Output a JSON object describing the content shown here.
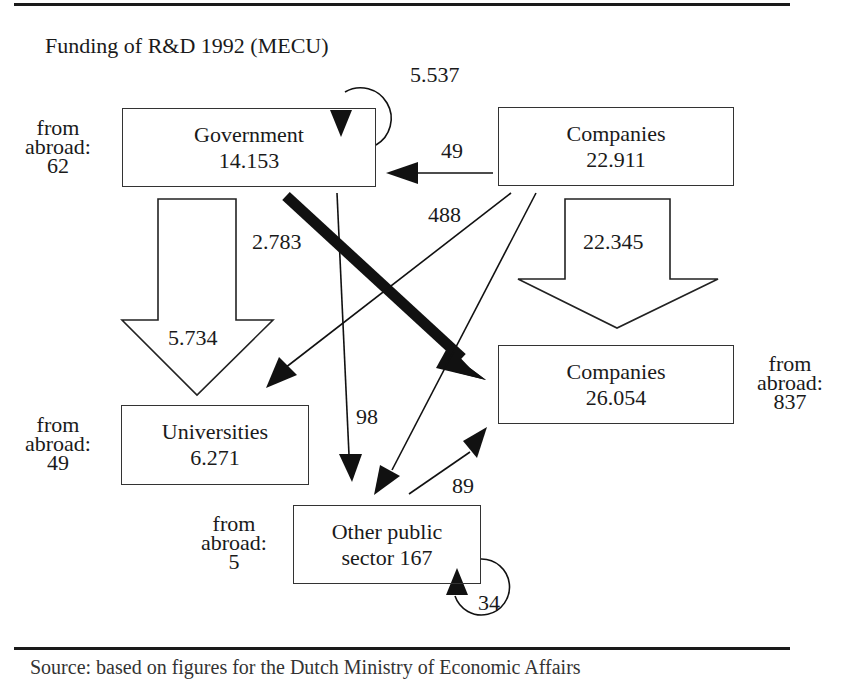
{
  "title": "Funding of R&D 1992 (MECU)",
  "nodes": {
    "government": {
      "name": "Government",
      "value": "14.153",
      "abroad_label": "from abroad:",
      "abroad_value": "62"
    },
    "companies_source": {
      "name": "Companies",
      "value": "22.911"
    },
    "companies_target": {
      "name": "Companies",
      "value": "26.054",
      "abroad_label": "from abroad:",
      "abroad_value": "837"
    },
    "universities": {
      "name": "Universities",
      "value": "6.271",
      "abroad_label": "from abroad:",
      "abroad_value": "49"
    },
    "other_public": {
      "name": "Other public",
      "name2": "sector 167",
      "abroad_label": "from abroad:",
      "abroad_value": "5"
    }
  },
  "flows": [
    {
      "from": "Government",
      "to": "Government",
      "value": "5.537"
    },
    {
      "from": "Companies",
      "to": "Government",
      "value": "49"
    },
    {
      "from": "Government",
      "to": "Universities",
      "value": "5.734"
    },
    {
      "from": "Government",
      "to": "Companies",
      "value": "2.783"
    },
    {
      "from": "Government",
      "to": "Other public sector",
      "value": "98"
    },
    {
      "from": "Companies",
      "to": "Universities",
      "value": "488"
    },
    {
      "from": "Companies",
      "to": "Companies",
      "value": "22.345"
    },
    {
      "from": "Other public sector",
      "to": "Companies",
      "value": "89"
    },
    {
      "from": "Other public sector",
      "to": "Other public sector",
      "value": "34"
    }
  ],
  "labels": {
    "gov_self": "5.537",
    "comp_to_gov": "49",
    "gov_to_univ": "5.734",
    "gov_to_comp": "2.783",
    "gov_to_other": "98",
    "comp_to_univ": "488",
    "comp_to_comp": "22.345",
    "other_to_comp": "89",
    "other_self": "34"
  },
  "footer": "Source: based on figures for the Dutch Ministry of Economic Affairs"
}
